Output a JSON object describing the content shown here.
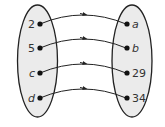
{
  "diagram": {
    "type": "mapping-diagram",
    "domain": [
      "2",
      "5",
      "c",
      "d"
    ],
    "range": [
      "a",
      "b",
      "29",
      "34"
    ],
    "italic": {
      "domain": [
        false,
        false,
        true,
        true
      ],
      "range": [
        true,
        true,
        false,
        false
      ]
    },
    "mappings": [
      {
        "from": "2",
        "to": "a"
      },
      {
        "from": "5",
        "to": "b"
      },
      {
        "from": "c",
        "to": "29"
      },
      {
        "from": "d",
        "to": "34"
      }
    ],
    "colors": {
      "oval_fill": "#ebebeb",
      "stroke": "#222222"
    }
  }
}
